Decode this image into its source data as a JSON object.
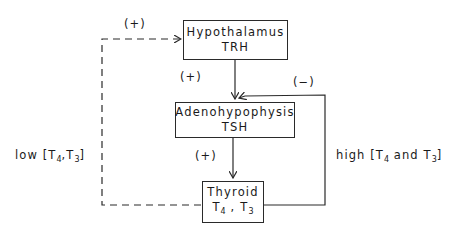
{
  "diagram": {
    "nodes": [
      {
        "id": "hypothalamus",
        "title": "Hypothalamus",
        "hormone": "TRH"
      },
      {
        "id": "adenohypophysis",
        "title": "Adenohypophysis",
        "hormone": "TSH"
      },
      {
        "id": "thyroid",
        "title": "Thyroid",
        "hormone_parts": [
          "T",
          "4",
          " , ",
          "T",
          "3"
        ]
      }
    ],
    "edges": [
      {
        "from": "hypothalamus",
        "to": "adenohypophysis",
        "label": "(+)",
        "style": "solid"
      },
      {
        "from": "adenohypophysis",
        "to": "thyroid",
        "label": "(+)",
        "style": "solid"
      },
      {
        "from": "thyroid",
        "to": "adenohypophysis",
        "label": "(−)",
        "style": "solid"
      },
      {
        "from": "thyroid",
        "to": "hypothalamus",
        "label": "(+)",
        "style": "dashed"
      }
    ],
    "labels": {
      "plus_top": "(+)",
      "plus_mid": "(+)",
      "plus_low": "(+)",
      "minus": "(−)",
      "low_prefix": "low [T",
      "low_sub1": "4",
      "low_mid": ",T",
      "low_sub2": "3",
      "low_suffix": "]",
      "high_prefix": "high [T",
      "high_sub1": "4",
      "high_mid": " and T",
      "high_sub2": "3",
      "high_suffix": "]"
    }
  }
}
